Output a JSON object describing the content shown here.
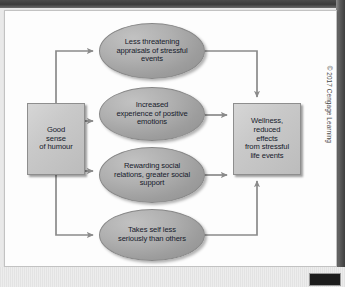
{
  "figure": {
    "credit": "© 2017 Cengage Learning",
    "nodes": {
      "source": {
        "id": "good-sense-of-humour",
        "shape": "rect",
        "label": "Good\nsense\nof humour"
      },
      "outcome": {
        "id": "wellness-reduced-effects",
        "shape": "rect",
        "label": "Wellness,\nreduced\neffects\nfrom stressful\nlife events"
      },
      "mediators": [
        {
          "id": "less-threatening-appraisals",
          "shape": "ellipse",
          "label": "Less threatening\nappraisals of stressful\nevents"
        },
        {
          "id": "increased-positive-emotions",
          "shape": "ellipse",
          "label": "Increased\nexperience of positive\nemotions"
        },
        {
          "id": "rewarding-social-relations",
          "shape": "ellipse",
          "label": "Rewarding social\nrelations, greater social\nsupport"
        },
        {
          "id": "takes-self-less-seriously",
          "shape": "ellipse",
          "label": "Takes self less\nseriously than others"
        }
      ]
    },
    "edges": [
      {
        "from": "good-sense-of-humour",
        "to": "less-threatening-appraisals"
      },
      {
        "from": "good-sense-of-humour",
        "to": "increased-positive-emotions"
      },
      {
        "from": "good-sense-of-humour",
        "to": "rewarding-social-relations"
      },
      {
        "from": "good-sense-of-humour",
        "to": "takes-self-less-seriously"
      },
      {
        "from": "less-threatening-appraisals",
        "to": "wellness-reduced-effects"
      },
      {
        "from": "increased-positive-emotions",
        "to": "wellness-reduced-effects"
      },
      {
        "from": "rewarding-social-relations",
        "to": "wellness-reduced-effects"
      },
      {
        "from": "takes-self-less-seriously",
        "to": "wellness-reduced-effects"
      }
    ],
    "colors": {
      "rect_fill": "#c9c9c9",
      "ellipse_fill": "#a4a4a4",
      "stroke": "#8e8e8e",
      "text": "#161a2b",
      "connector": "#8a8a8a",
      "card_background": "#fdfdfd",
      "page_background": "#e9e9e9"
    }
  }
}
